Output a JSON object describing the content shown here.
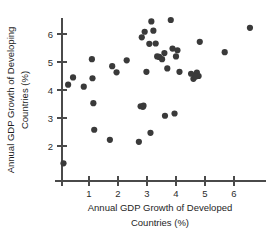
{
  "chart_data": {
    "type": "scatter",
    "title": "",
    "xlabel": "Annual GDP Growth of Developed Countries (%)",
    "ylabel": "Annual GDP Growth of Developing Countries (%)",
    "xlabel_line1": "Annual GDP Growth of Developed",
    "xlabel_line2": "Countries (%)",
    "ylabel_line1": "Annual GDP Growth of Developing",
    "ylabel_line2": "Countries (%)",
    "xlim": [
      -0.15,
      7.0
    ],
    "ylim": [
      1.1,
      6.9
    ],
    "xticks": [
      1,
      2,
      3,
      4,
      5,
      6
    ],
    "yticks": [
      2,
      3,
      4,
      5,
      6
    ],
    "xtick_labels": [
      "1",
      "2",
      "3",
      "4",
      "5",
      "6"
    ],
    "ytick_labels": [
      "2",
      "3",
      "4",
      "5",
      "6"
    ],
    "grid": false,
    "legend": "none",
    "marker": "filled-circle",
    "marker_color": "#3a3a3a",
    "marker_size": 3.1,
    "n_points": 44,
    "series": [
      {
        "name": "Countries",
        "points": [
          [
            0.12,
            1.38
          ],
          [
            0.28,
            4.19
          ],
          [
            0.45,
            4.45
          ],
          [
            0.82,
            4.12
          ],
          [
            1.1,
            5.1
          ],
          [
            1.12,
            4.42
          ],
          [
            1.15,
            3.53
          ],
          [
            1.18,
            2.58
          ],
          [
            1.72,
            2.22
          ],
          [
            1.8,
            4.85
          ],
          [
            1.95,
            4.63
          ],
          [
            2.3,
            5.06
          ],
          [
            2.72,
            2.15
          ],
          [
            2.78,
            3.42
          ],
          [
            2.86,
            3.4
          ],
          [
            2.82,
            5.88
          ],
          [
            2.92,
            6.08
          ],
          [
            2.98,
            4.65
          ],
          [
            3.08,
            5.65
          ],
          [
            3.12,
            2.47
          ],
          [
            3.15,
            6.45
          ],
          [
            3.22,
            6.12
          ],
          [
            3.3,
            5.66
          ],
          [
            3.42,
            5.18
          ],
          [
            3.52,
            5.1
          ],
          [
            3.6,
            5.32
          ],
          [
            3.62,
            3.08
          ],
          [
            3.7,
            4.77
          ],
          [
            3.82,
            6.5
          ],
          [
            3.88,
            5.48
          ],
          [
            3.95,
            3.16
          ],
          [
            4.0,
            5.2
          ],
          [
            4.05,
            5.42
          ],
          [
            4.12,
            4.65
          ],
          [
            4.52,
            4.58
          ],
          [
            4.6,
            4.4
          ],
          [
            4.72,
            4.62
          ],
          [
            4.78,
            4.5
          ],
          [
            4.82,
            5.72
          ],
          [
            5.68,
            5.35
          ],
          [
            6.55,
            6.22
          ],
          [
            2.88,
            3.44
          ],
          [
            4.68,
            4.48
          ],
          [
            3.35,
            5.2
          ]
        ]
      }
    ]
  },
  "axes": {
    "x_axis_name": "x-axis",
    "y_axis_name": "y-axis"
  }
}
